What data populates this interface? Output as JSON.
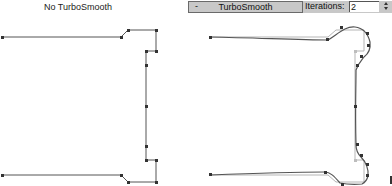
{
  "left_panel": {
    "title": "No TurboSmooth"
  },
  "rollout": {
    "collapse_symbol": "-",
    "title": "TurboSmooth",
    "iterations_label": "Iterations:",
    "iterations_value": "2",
    "spinner_icon": "spinner-up-down"
  },
  "colors": {
    "curve": "#555555",
    "cage": "#b0b0b0",
    "vertex": "#333333",
    "rollout_bg": "#c8c8c8"
  }
}
